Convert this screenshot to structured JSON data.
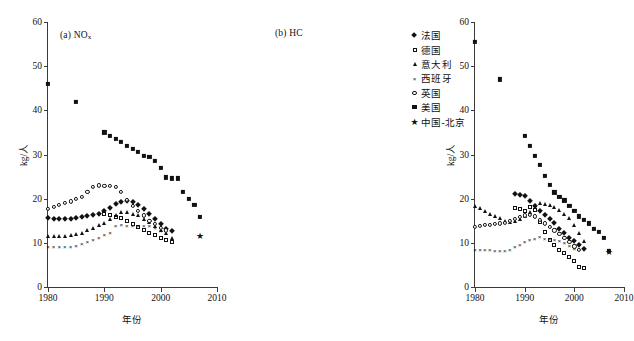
{
  "figure": {
    "axis_title_y": "kg/人",
    "axis_title_x": "年份",
    "panel_a_label": "(a)  NO",
    "panel_a_sub": "x",
    "panel_b_label": "(b)  HC"
  },
  "legend": {
    "items": [
      {
        "label": "法国",
        "marker": "filled-diamond-marker",
        "glyph": "◆"
      },
      {
        "label": "德国",
        "marker": "open-square-marker",
        "glyph": "□"
      },
      {
        "label": "意大利",
        "marker": "filled-triangle-marker",
        "glyph": "▲"
      },
      {
        "label": "西班牙",
        "marker": "cross-marker",
        "glyph": "×"
      },
      {
        "label": "英国",
        "marker": "open-circle-marker",
        "glyph": "○"
      },
      {
        "label": "美国",
        "marker": "filled-square-marker",
        "glyph": "■"
      },
      {
        "label": "中国-北京",
        "marker": "filled-star-marker",
        "glyph": "★"
      }
    ]
  },
  "chart_data": [
    {
      "type": "scatter",
      "id": "panel-a",
      "title": "(a) NOx",
      "xlabel": "年份",
      "ylabel": "kg/人",
      "xlim": [
        1980,
        2010
      ],
      "ylim": [
        0,
        60
      ],
      "xticks": [
        1980,
        1990,
        2000,
        2010
      ],
      "yticks": [
        0,
        10,
        20,
        30,
        40,
        50,
        60
      ],
      "grid": false,
      "legend_position": "right-outside",
      "series": [
        {
          "name": "法国",
          "marker": "filled-diamond",
          "x": [
            1980,
            1981,
            1982,
            1983,
            1984,
            1985,
            1986,
            1987,
            1988,
            1989,
            1990,
            1991,
            1992,
            1993,
            1994,
            1995,
            1996,
            1997,
            1998,
            1999,
            2000,
            2001,
            2002
          ],
          "y": [
            15.6,
            15.4,
            15.3,
            15.3,
            15.5,
            15.6,
            15.8,
            16.1,
            16.4,
            16.6,
            17.2,
            18.0,
            18.8,
            19.3,
            19.4,
            19.2,
            18.6,
            17.6,
            16.6,
            15.4,
            14.2,
            13.2,
            12.6
          ]
        },
        {
          "name": "德国",
          "marker": "open-square",
          "x": [
            1990,
            1991,
            1992,
            1993,
            1994,
            1995,
            1996,
            1997,
            1998,
            1999,
            2000,
            2001,
            2002
          ],
          "y": [
            16.6,
            16.2,
            15.9,
            15.6,
            14.9,
            14.2,
            13.6,
            12.9,
            12.3,
            11.7,
            11.1,
            10.6,
            10.3
          ]
        },
        {
          "name": "意大利",
          "marker": "filled-triangle",
          "x": [
            1980,
            1981,
            1982,
            1983,
            1984,
            1985,
            1986,
            1987,
            1988,
            1989,
            1990,
            1991,
            1992,
            1993,
            1994,
            1995,
            1996,
            1997,
            1998,
            1999,
            2000,
            2001,
            2002
          ],
          "y": [
            11.5,
            11.5,
            11.5,
            11.6,
            11.8,
            12.0,
            12.2,
            12.8,
            13.4,
            14.0,
            14.6,
            15.4,
            16.2,
            16.9,
            17.0,
            16.6,
            16.2,
            15.5,
            14.7,
            13.8,
            13.0,
            12.3,
            11.0
          ]
        },
        {
          "name": "西班牙",
          "marker": "cross",
          "x": [
            1980,
            1981,
            1982,
            1983,
            1984,
            1985,
            1986,
            1987,
            1988,
            1989,
            1990,
            1991,
            1992,
            1993,
            1994,
            1995,
            1996,
            1997,
            1998,
            1999,
            2000
          ],
          "y": [
            9.2,
            9.2,
            9.2,
            9.2,
            9.2,
            9.4,
            9.9,
            10.4,
            10.9,
            11.4,
            12.0,
            12.4,
            14.0,
            14.3,
            14.1,
            14.0,
            14.0,
            14.0,
            14.0,
            13.6,
            13.0
          ]
        },
        {
          "name": "英国",
          "marker": "open-circle",
          "x": [
            1980,
            1981,
            1982,
            1983,
            1984,
            1985,
            1986,
            1987,
            1988,
            1989,
            1990,
            1991,
            1992,
            1993,
            1994,
            1995,
            1996,
            1997,
            1998,
            1999,
            2000,
            2001
          ],
          "y": [
            17.6,
            18.1,
            18.6,
            19.0,
            19.4,
            19.9,
            20.4,
            21.5,
            22.6,
            23.0,
            22.9,
            22.8,
            22.6,
            21.5,
            19.7,
            18.4,
            17.2,
            16.2,
            15.0,
            14.2,
            13.4,
            12.8
          ]
        },
        {
          "name": "美国",
          "marker": "filled-square",
          "x": [
            1980,
            1985,
            1990,
            1991,
            1992,
            1993,
            1994,
            1995,
            1996,
            1997,
            1998,
            1999,
            2000,
            2001,
            2002,
            2003,
            2004,
            2005,
            2006,
            2007
          ],
          "y": [
            46.0,
            42.0,
            35.0,
            34.3,
            33.6,
            32.9,
            32.0,
            31.2,
            30.5,
            29.6,
            29.4,
            28.5,
            27.0,
            24.8,
            24.6,
            24.6,
            21.6,
            20.0,
            18.5,
            15.8
          ]
        },
        {
          "name": "中国-北京",
          "marker": "filled-star",
          "x": [
            2007
          ],
          "y": [
            11.5
          ]
        }
      ]
    },
    {
      "type": "scatter",
      "id": "panel-b",
      "title": "(b) HC",
      "xlabel": "年份",
      "ylabel": "kg/人",
      "xlim": [
        1980,
        2010
      ],
      "ylim": [
        0,
        60
      ],
      "xticks": [
        1980,
        1990,
        2000,
        2010
      ],
      "yticks": [
        0,
        10,
        20,
        30,
        40,
        50,
        60
      ],
      "grid": false,
      "legend_position": "right-outside",
      "series": [
        {
          "name": "法国",
          "marker": "filled-diamond",
          "x": [
            1988,
            1989,
            1990,
            1991,
            1992,
            1993,
            1994,
            1995,
            1996,
            1997,
            1998,
            1999,
            2000,
            2001,
            2002
          ],
          "y": [
            21.0,
            20.8,
            20.6,
            19.4,
            18.4,
            17.2,
            16.3,
            15.4,
            14.4,
            13.2,
            12.2,
            11.2,
            10.4,
            9.6,
            8.6
          ]
        },
        {
          "name": "德国",
          "marker": "open-square",
          "x": [
            1988,
            1989,
            1990,
            1991,
            1992,
            1993,
            1994,
            1995,
            1996,
            1997,
            1998,
            1999,
            2000,
            2001,
            2002
          ],
          "y": [
            18.0,
            17.6,
            17.2,
            18.2,
            17.4,
            14.8,
            12.4,
            10.6,
            9.4,
            8.4,
            7.6,
            6.8,
            6.0,
            4.6,
            4.2
          ]
        },
        {
          "name": "意大利",
          "marker": "filled-triangle",
          "x": [
            1980,
            1981,
            1982,
            1983,
            1984,
            1985,
            1986,
            1987,
            1988,
            1989,
            1990,
            1991,
            1992,
            1993,
            1994,
            1995,
            1996,
            1997,
            1998,
            1999,
            2000,
            2001,
            2002
          ],
          "y": [
            18.4,
            17.8,
            17.2,
            16.6,
            16.0,
            15.6,
            15.0,
            14.8,
            15.0,
            15.4,
            16.0,
            17.0,
            18.2,
            19.0,
            18.9,
            18.6,
            18.2,
            17.4,
            16.6,
            15.6,
            14.0,
            12.2,
            10.4
          ]
        },
        {
          "name": "西班牙",
          "marker": "cross",
          "x": [
            1980,
            1981,
            1982,
            1983,
            1984,
            1985,
            1986,
            1987,
            1988,
            1989,
            1990,
            1991,
            1992,
            1993,
            1994,
            1995,
            1996,
            1997,
            1998,
            1999,
            2000
          ],
          "y": [
            8.6,
            8.6,
            8.5,
            8.5,
            8.4,
            8.3,
            8.3,
            8.6,
            9.2,
            9.8,
            10.4,
            10.8,
            11.2,
            11.5,
            11.2,
            11.0,
            10.8,
            10.6,
            10.2,
            9.6,
            8.8
          ]
        },
        {
          "name": "英国",
          "marker": "open-circle",
          "x": [
            1980,
            1981,
            1982,
            1983,
            1984,
            1985,
            1986,
            1987,
            1988,
            1989,
            1990,
            1991,
            1992,
            1993,
            1994,
            1995,
            1996,
            1997,
            1998,
            1999,
            2000,
            2001
          ],
          "y": [
            13.6,
            13.8,
            14.0,
            14.1,
            14.3,
            14.4,
            14.6,
            15.0,
            15.4,
            15.8,
            16.2,
            16.4,
            16.0,
            15.2,
            14.4,
            13.6,
            12.8,
            12.0,
            11.2,
            10.2,
            9.2,
            8.4
          ]
        },
        {
          "name": "美国",
          "marker": "filled-square",
          "x": [
            1980,
            1985,
            1990,
            1991,
            1992,
            1993,
            1994,
            1995,
            1996,
            1997,
            1998,
            1999,
            2000,
            2001,
            2002,
            2003,
            2004,
            2005,
            2006,
            2007
          ],
          "y": [
            55.5,
            47.0,
            34.2,
            32.0,
            29.6,
            27.6,
            25.2,
            23.2,
            21.4,
            20.4,
            19.6,
            18.4,
            17.2,
            16.0,
            15.2,
            14.4,
            13.2,
            12.4,
            11.2,
            8.2
          ]
        },
        {
          "name": "中国-北京",
          "marker": "filled-star",
          "x": [
            2007
          ],
          "y": [
            8.0
          ]
        }
      ]
    }
  ]
}
